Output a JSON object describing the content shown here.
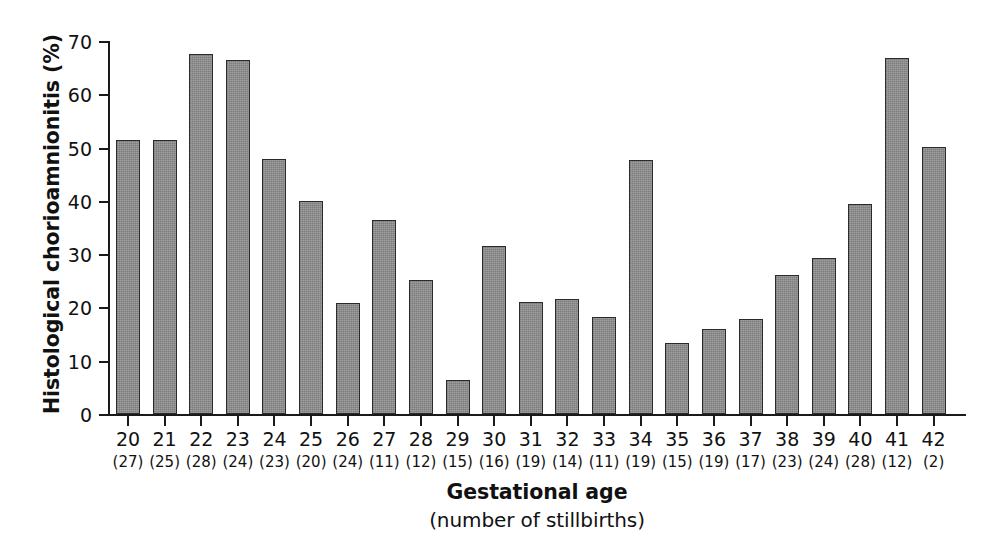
{
  "chart_data": {
    "type": "bar",
    "title": "",
    "xlabel": "Gestational age",
    "xlabel_sub": "(number of stillbirths)",
    "ylabel": "Histological chorioamnionitis (%)",
    "ylim": [
      0,
      70
    ],
    "yticks": [
      0,
      10,
      20,
      30,
      40,
      50,
      60,
      70
    ],
    "ytick_labels": [
      "0",
      "10",
      "20",
      "30",
      "40",
      "50",
      "60",
      "70"
    ],
    "grid": false,
    "legend": null,
    "bar_color": "#8c8c8c",
    "bar_edge_color": "#2b2b2b",
    "axis_color": "#1a1a1a",
    "categories": [
      "20",
      "21",
      "22",
      "23",
      "24",
      "25",
      "26",
      "27",
      "28",
      "29",
      "30",
      "31",
      "32",
      "33",
      "34",
      "35",
      "36",
      "37",
      "38",
      "39",
      "40",
      "41",
      "42"
    ],
    "counts": [
      "(27)",
      "(25)",
      "(28)",
      "(24)",
      "(23)",
      "(20)",
      "(24)",
      "(11)",
      "(12)",
      "(15)",
      "(16)",
      "(19)",
      "(14)",
      "(11)",
      "(19)",
      "(15)",
      "(19)",
      "(17)",
      "(23)",
      "(24)",
      "(28)",
      "(12)",
      "(2)"
    ],
    "values": [
      51.5,
      51.5,
      67.6,
      66.4,
      47.8,
      40.0,
      20.8,
      36.5,
      25.1,
      6.4,
      31.5,
      21.0,
      21.5,
      18.2,
      47.6,
      13.4,
      15.9,
      17.8,
      26.1,
      29.3,
      39.4,
      66.8,
      50.2
    ]
  }
}
